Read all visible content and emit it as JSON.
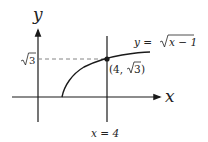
{
  "diagram": {
    "axes": {
      "x_label": "x",
      "y_label": "y"
    },
    "curve": {
      "equation_lhs": "y =",
      "equation_radicand": "x − 1",
      "function": "sqrt(x-1)",
      "domain_start": 1
    },
    "point": {
      "label_open": "(4, ",
      "label_radicand": "3",
      "label_close": ")",
      "x": 4,
      "y": "sqrt(3)"
    },
    "y_tick": {
      "radicand": "3"
    },
    "vertical_line": {
      "label": "x = 4"
    },
    "colors": {
      "stroke": "#1a1a1a",
      "dashed": "#777777",
      "text": "#222222"
    }
  }
}
